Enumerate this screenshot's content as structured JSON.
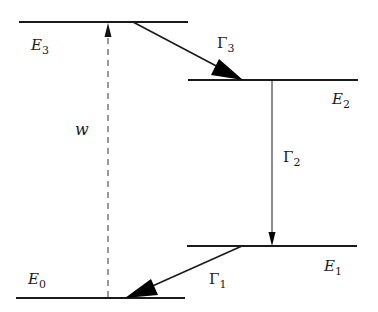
{
  "diagram": {
    "type": "energy-level-diagram",
    "levels": [
      {
        "id": "E3",
        "label": "E",
        "sub": "3",
        "y": 22,
        "x1": 19,
        "x2": 188
      },
      {
        "id": "E2",
        "label": "E",
        "sub": "2",
        "y": 80,
        "x1": 188,
        "x2": 358
      },
      {
        "id": "E1",
        "label": "E",
        "sub": "1",
        "y": 246,
        "x1": 187,
        "x2": 357
      },
      {
        "id": "E0",
        "label": "E",
        "sub": "0",
        "y": 298,
        "x1": 16,
        "x2": 185
      }
    ],
    "transitions": [
      {
        "id": "w",
        "label": "w",
        "sub": "",
        "from": "E0",
        "to": "E3",
        "style": "dashed"
      },
      {
        "id": "Gamma3",
        "label": "Γ",
        "sub": "3",
        "from": "E3",
        "to": "E2",
        "style": "solid-bold-head"
      },
      {
        "id": "Gamma2",
        "label": "Γ",
        "sub": "2",
        "from": "E2",
        "to": "E1",
        "style": "solid-thin-head"
      },
      {
        "id": "Gamma1",
        "label": "Γ",
        "sub": "1",
        "from": "E1",
        "to": "E0",
        "style": "solid-bold-head"
      }
    ]
  },
  "colors": {
    "line": "#1a1a1a",
    "dashed": "#555555",
    "background": "#ffffff"
  }
}
